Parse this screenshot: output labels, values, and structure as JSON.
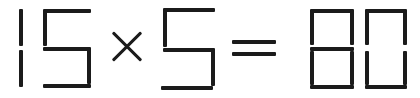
{
  "puzzle": {
    "type": "matchstick-equation",
    "equation_text": "15 x 5 = 80",
    "left_operand": "15",
    "operator": "x",
    "right_operand": "5",
    "equals": "=",
    "result": "80",
    "is_valid": "false"
  },
  "colors": {
    "background": "#ffffff",
    "stick": "#1b1b1b"
  },
  "labels": {
    "digit_1": "1",
    "digit_5a": "5",
    "multiply": "×",
    "digit_5b": "5",
    "equals": "=",
    "digit_8": "8",
    "digit_0": "0"
  },
  "segments": {
    "digit_1": [
      "top-left-vertical",
      "bottom-left-vertical"
    ],
    "digit_5a": [
      "top-bar",
      "top-left-vertical",
      "middle-bar",
      "bottom-right-vertical",
      "bottom-bar"
    ],
    "digit_5b": [
      "top-bar",
      "top-left-vertical",
      "middle-bar",
      "bottom-right-vertical",
      "bottom-bar"
    ],
    "digit_8": [
      "top-bar",
      "top-left-vertical",
      "top-right-vertical",
      "middle-bar",
      "bottom-left-vertical",
      "bottom-right-vertical",
      "bottom-bar"
    ],
    "digit_0": [
      "top-bar",
      "top-left-vertical",
      "top-right-vertical",
      "bottom-left-vertical",
      "bottom-right-vertical",
      "bottom-bar"
    ],
    "equals": [
      "upper-bar",
      "lower-bar"
    ],
    "multiply": [
      "stroke-down-right",
      "stroke-down-left"
    ]
  }
}
